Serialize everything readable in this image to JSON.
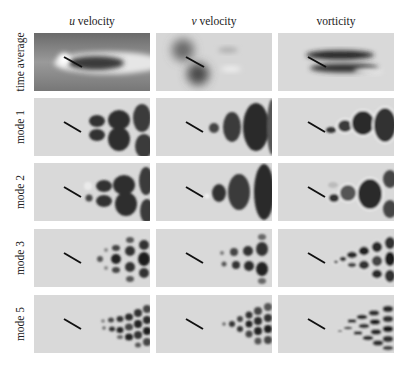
{
  "figure": {
    "columns": [
      {
        "label_italic": "u",
        "label_rest": " velocity"
      },
      {
        "label_italic": "v",
        "label_rest": " velocity"
      },
      {
        "label_italic": "",
        "label_rest": "vorticity"
      }
    ],
    "rows": [
      {
        "label": "time average"
      },
      {
        "label": "mode 1"
      },
      {
        "label": "mode 2"
      },
      {
        "label": "mode 3"
      },
      {
        "label": "mode 5"
      }
    ],
    "colors": {
      "background": "#d9d9d9",
      "dark": "#1e1e1e",
      "light": "#f4f4f4",
      "plate": "#111111"
    }
  }
}
